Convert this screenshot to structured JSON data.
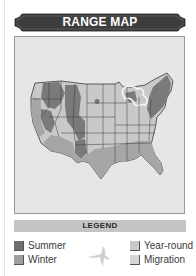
{
  "banner": {
    "title": "RANGE MAP",
    "color": "#3d3d3d"
  },
  "map": {
    "region": "Contiguous United States",
    "background_color": "#e6e6e6",
    "colors": {
      "summer": "#7a7a7a",
      "winter": "#a6a6a6",
      "year_round": "#c9c9c9",
      "migration": "#d2d2d2",
      "state_border": "#3a3a3a",
      "lakes": "#f2f2f2"
    }
  },
  "legend": {
    "title": "LEGEND",
    "icon": "bird-in-flight-icon",
    "items": [
      {
        "key": "summer",
        "label": "Summer",
        "color": "#6e6e6e"
      },
      {
        "key": "winter",
        "label": "Winter",
        "color": "#9f9f9f"
      },
      {
        "key": "year_round",
        "label": "Year-round",
        "color": "#c8c8c8"
      },
      {
        "key": "migration",
        "label": "Migration",
        "color": "#d6d6d6"
      }
    ]
  }
}
